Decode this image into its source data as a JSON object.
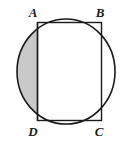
{
  "figure": {
    "background_color": "#ffffff",
    "stroke_color": "#1a1a1a",
    "shaded_fill_color": "#c9c9c9",
    "unshaded_fill_color": "#ffffff",
    "circle": {
      "center_x": 66,
      "center_y": 71.5,
      "radius_x": 49,
      "radius_y": 52.5,
      "stroke_width": 1.6
    },
    "rectangle": {
      "left_x": 37.5,
      "right_x": 101.5,
      "top_y": 22.5,
      "bottom_y": 120.5,
      "stroke_width": 1.4
    },
    "shaded_segment": {
      "description": "minor circular segment left of chord AD",
      "chord_x": 37.5,
      "top_y": 22.5,
      "bottom_y": 120.5
    },
    "labels": [
      {
        "id": "A",
        "text": "A",
        "x": 33,
        "y": 17,
        "anchor": "middle"
      },
      {
        "id": "B",
        "text": "B",
        "x": 100,
        "y": 17,
        "anchor": "middle"
      },
      {
        "id": "C",
        "text": "C",
        "x": 99,
        "y": 136,
        "anchor": "middle"
      },
      {
        "id": "D",
        "text": "D",
        "x": 33,
        "y": 136,
        "anchor": "middle"
      }
    ]
  }
}
